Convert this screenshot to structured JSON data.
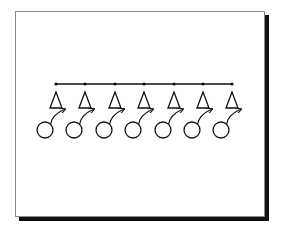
{
  "diagram": {
    "bus": {
      "y": 84,
      "x_start": 56,
      "x_end": 232,
      "dot_radius": 1.6
    },
    "units": [
      {
        "x": 56
      },
      {
        "x": 85
      },
      {
        "x": 115
      },
      {
        "x": 144
      },
      {
        "x": 174
      },
      {
        "x": 203
      },
      {
        "x": 232
      }
    ],
    "triangle": {
      "apex_dy": 8,
      "base_dy": 24,
      "half_width": 6
    },
    "circle": {
      "dx": -11,
      "dy": 46,
      "r": 8
    },
    "colors": {
      "stroke": "#111111",
      "background": "#ffffff",
      "frame_border": "#8a8a8a",
      "shadow": "#111111"
    }
  }
}
